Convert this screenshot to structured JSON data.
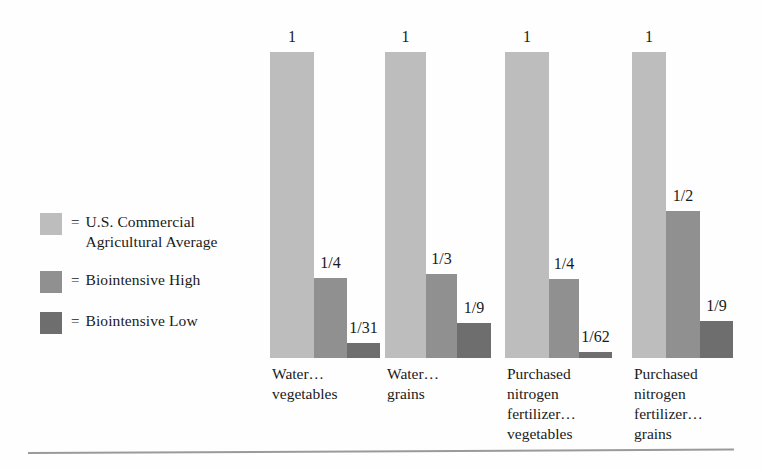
{
  "legend": {
    "items": [
      {
        "swatch_name": "legend-swatch-commercial",
        "eq": "=",
        "label": "U.S. Commercial\nAgricultural Average",
        "color": "#bdbdbd"
      },
      {
        "swatch_name": "legend-swatch-biointensive-high",
        "eq": "=",
        "label": "Biointensive High",
        "color": "#909090"
      },
      {
        "swatch_name": "legend-swatch-biointensive-low",
        "eq": "=",
        "label": "Biointensive Low",
        "color": "#6e6e6e"
      }
    ]
  },
  "chart_data": {
    "type": "bar",
    "title": "",
    "xlabel": "",
    "ylabel": "",
    "ylim": [
      0,
      1
    ],
    "grid": false,
    "legend_position": "left",
    "categories": [
      "Water…\nvegetables",
      "Water…\ngrains",
      "Purchased\nnitrogen\nfertilizer…\nvegetables",
      "Purchased\nnitrogen\nfertilizer…\ngrains"
    ],
    "series": [
      {
        "name": "U.S. Commercial Agricultural Average",
        "color": "#bdbdbd",
        "labels": [
          "1",
          "1",
          "1",
          "1"
        ],
        "values": [
          1,
          1,
          1,
          1
        ]
      },
      {
        "name": "Biointensive High",
        "color": "#909090",
        "labels": [
          "1/4",
          "1/3",
          "1/4",
          "1/2"
        ],
        "values": [
          0.25,
          0.3333,
          0.25,
          0.5
        ]
      },
      {
        "name": "Biointensive Low",
        "color": "#6e6e6e",
        "labels": [
          "1/31",
          "1/9",
          "1/62",
          "1/9"
        ],
        "values": [
          0.0323,
          0.1111,
          0.0161,
          0.1111
        ]
      }
    ]
  },
  "groups": [
    {
      "caption": "Water…\nvegetables",
      "left": 270,
      "bars": [
        {
          "label": "1",
          "frac": 1.0,
          "width": 44,
          "color": "#bdbdbd"
        },
        {
          "label": "1/4",
          "frac": 0.262,
          "width": 33,
          "color": "#909090"
        },
        {
          "label": "1/31",
          "frac": 0.049,
          "width": 33,
          "color": "#6e6e6e"
        }
      ]
    },
    {
      "caption": "Water…\ngrains",
      "left": 385,
      "bars": [
        {
          "label": "1",
          "frac": 1.0,
          "width": 41,
          "color": "#bdbdbd"
        },
        {
          "label": "1/3",
          "frac": 0.276,
          "width": 31,
          "color": "#909090"
        },
        {
          "label": "1/9",
          "frac": 0.114,
          "width": 34,
          "color": "#6e6e6e"
        }
      ]
    },
    {
      "caption": "Purchased\nnitrogen\nfertilizer…\nvegetables",
      "left": 505,
      "bars": [
        {
          "label": "1",
          "frac": 1.0,
          "width": 44,
          "color": "#bdbdbd"
        },
        {
          "label": "1/4",
          "frac": 0.259,
          "width": 30,
          "color": "#909090"
        },
        {
          "label": "1/62",
          "frac": 0.02,
          "width": 33,
          "color": "#6e6e6e"
        }
      ]
    },
    {
      "caption": "Purchased\nnitrogen\nfertilizer…\ngrains",
      "left": 632,
      "bars": [
        {
          "label": "1",
          "frac": 1.0,
          "width": 34,
          "color": "#bdbdbd"
        },
        {
          "label": "1/2",
          "frac": 0.48,
          "width": 34,
          "color": "#909090"
        },
        {
          "label": "1/9",
          "frac": 0.121,
          "width": 33,
          "color": "#6e6e6e"
        }
      ]
    }
  ]
}
